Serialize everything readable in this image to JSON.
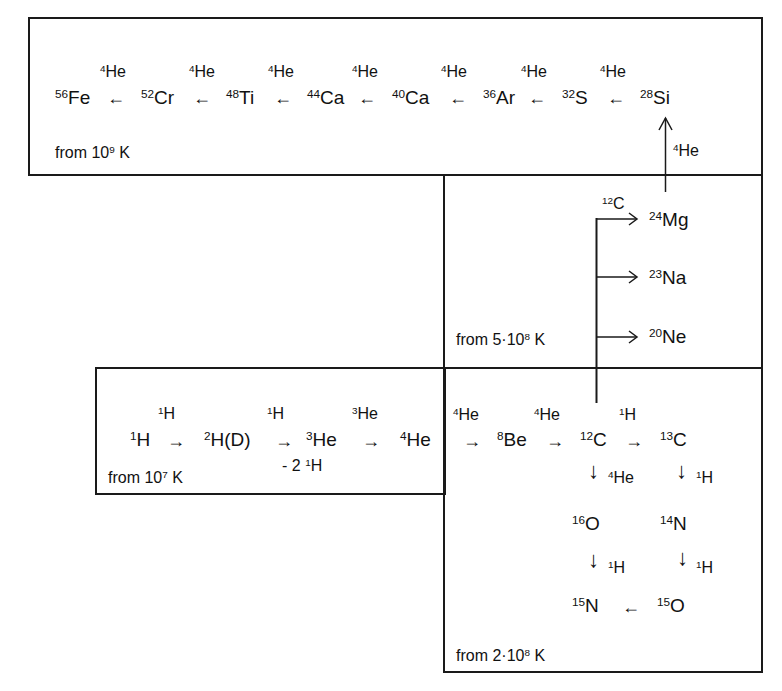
{
  "boxes": {
    "silicon_burning": {
      "label_pre": "from 10",
      "label_exp": "9",
      "label_post": " K"
    },
    "carbon_burning": {
      "label_pre": "from 5·10",
      "label_exp": "8",
      "label_post": " K"
    },
    "hydrogen_burning": {
      "label_pre": "from 10",
      "label_exp": "7",
      "label_post": " K"
    },
    "helium_burning": {
      "label_pre": "from 2·10",
      "label_exp": "8",
      "label_post": " K"
    }
  },
  "alpha_chain": {
    "nuclides": [
      {
        "mass": "56",
        "sym": "Fe"
      },
      {
        "mass": "52",
        "sym": "Cr"
      },
      {
        "mass": "48",
        "sym": "Ti"
      },
      {
        "mass": "44",
        "sym": "Ca"
      },
      {
        "mass": "40",
        "sym": "Ca"
      },
      {
        "mass": "36",
        "sym": "Ar"
      },
      {
        "mass": "32",
        "sym": "S"
      },
      {
        "mass": "28",
        "sym": "Si"
      }
    ],
    "reactant": {
      "mass": "4",
      "sym": "He"
    },
    "arrow": "←"
  },
  "mg_to_si": {
    "reactant": {
      "mass": "4",
      "sym": "He"
    },
    "arrow": "↑"
  },
  "carbon_products": {
    "reactant": {
      "mass": "12",
      "sym": "C"
    },
    "products": [
      {
        "mass": "24",
        "sym": "Mg"
      },
      {
        "mass": "23",
        "sym": "Na"
      },
      {
        "mass": "20",
        "sym": "Ne"
      }
    ]
  },
  "pp_chain": {
    "steps": [
      {
        "mass": "1",
        "sym": "H"
      },
      {
        "mass": "2",
        "sym": "H(D)"
      },
      {
        "mass": "3",
        "sym": "He"
      },
      {
        "mass": "4",
        "sym": "He"
      }
    ],
    "reactants": [
      {
        "mass": "1",
        "sym": "H"
      },
      {
        "mass": "1",
        "sym": "H"
      },
      {
        "mass": "3",
        "sym": "He"
      }
    ],
    "byproduct": {
      "prefix": "- 2 ",
      "mass": "1",
      "sym": "H"
    },
    "arrow": "→"
  },
  "triple_alpha": {
    "reactant1": {
      "mass": "4",
      "sym": "He"
    },
    "be": {
      "mass": "8",
      "sym": "Be"
    },
    "reactant2": {
      "mass": "4",
      "sym": "He"
    },
    "c12": {
      "mass": "12",
      "sym": "C"
    },
    "reactant3": {
      "mass": "1",
      "sym": "H"
    },
    "c13": {
      "mass": "13",
      "sym": "C"
    }
  },
  "cno": {
    "c12_down": {
      "mass": "4",
      "sym": "He"
    },
    "c13_down": {
      "mass": "1",
      "sym": "H"
    },
    "o16": {
      "mass": "16",
      "sym": "O"
    },
    "n14": {
      "mass": "14",
      "sym": "N"
    },
    "o16_down": {
      "mass": "1",
      "sym": "H"
    },
    "n14_down": {
      "mass": "1",
      "sym": "H"
    },
    "n15": {
      "mass": "15",
      "sym": "N"
    },
    "o15": {
      "mass": "15",
      "sym": "O"
    },
    "arrow_left": "←",
    "arrow_right": "→",
    "arrow_down": "↓"
  }
}
